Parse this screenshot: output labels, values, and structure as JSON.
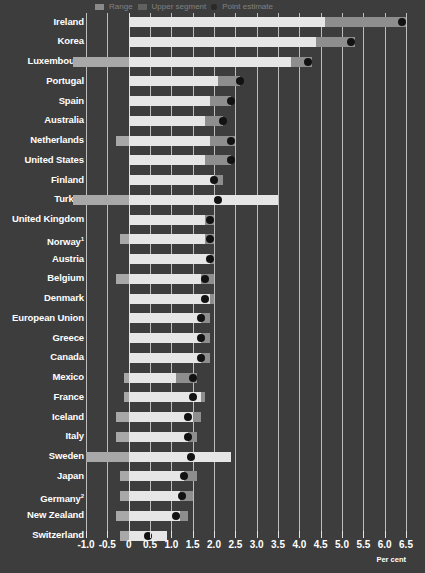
{
  "legend": {
    "items": [
      {
        "label": "Range",
        "swatch": "light-bar-swatch"
      },
      {
        "label": "Upper segment",
        "swatch": "dark-bar-swatch"
      },
      {
        "label": "Point estimate",
        "swatch": "black-dot-marker"
      }
    ]
  },
  "axis": {
    "title": "Per cent",
    "ticks": [
      "-1.0",
      "-0.5",
      "0",
      "0.5",
      "1.0",
      "1.5",
      "2.0",
      "2.5",
      "3.0",
      "3.5",
      "4.0",
      "4.5",
      "5.0",
      "5.5",
      "6.0",
      "6.5"
    ]
  },
  "footnotes": {
    "norway": "1",
    "germany": "2"
  },
  "colors": {
    "background": "#3d3d3d",
    "bar_light": "#e6e6e6",
    "bar_dark": "#8e8e8e",
    "bar_left": "#a8a8a8",
    "marker": "#121212",
    "gridline": "#d8d8d8",
    "text": "#ffffff"
  },
  "chart_data": {
    "type": "bar",
    "orientation": "horizontal",
    "title": "",
    "xlabel": "Per cent",
    "ylabel": "",
    "xlim": [
      -1.0,
      6.5
    ],
    "grid": true,
    "legend_position": "top",
    "categories": [
      "Ireland",
      "Korea",
      "Luxembourg",
      "Portugal",
      "Spain",
      "Australia",
      "Netherlands",
      "United States",
      "Finland",
      "Turkey",
      "United Kingdom",
      "Norway",
      "Austria",
      "Belgium",
      "Denmark",
      "European Union",
      "Greece",
      "Canada",
      "Mexico",
      "France",
      "Iceland",
      "Italy",
      "Sweden",
      "Japan",
      "Germany",
      "New Zealand",
      "Switzerland"
    ],
    "series": [
      {
        "name": "Range start",
        "values": [
          0.0,
          0.0,
          -1.3,
          0.0,
          0.0,
          0.0,
          -0.3,
          0.0,
          0.0,
          -1.3,
          0.0,
          -0.2,
          0.0,
          -0.3,
          0.0,
          0.0,
          0.0,
          0.0,
          -0.1,
          -0.1,
          -0.3,
          -0.3,
          -1.0,
          -0.2,
          -0.2,
          -0.3,
          -0.2
        ]
      },
      {
        "name": "Light segment end",
        "values": [
          4.6,
          4.4,
          3.8,
          2.1,
          1.9,
          1.8,
          1.9,
          1.8,
          2.0,
          3.5,
          1.8,
          1.8,
          1.9,
          1.7,
          1.9,
          1.7,
          1.7,
          1.7,
          1.1,
          1.7,
          1.5,
          1.4,
          2.4,
          1.3,
          1.2,
          1.2,
          0.9
        ]
      },
      {
        "name": "Dark segment end",
        "values": [
          6.5,
          5.3,
          4.3,
          2.6,
          2.4,
          2.2,
          2.5,
          2.4,
          2.2,
          3.5,
          2.0,
          2.0,
          2.0,
          2.0,
          2.0,
          1.9,
          1.9,
          1.9,
          1.6,
          1.8,
          1.7,
          1.6,
          2.4,
          1.6,
          1.5,
          1.4,
          0.9
        ]
      },
      {
        "name": "Point estimate",
        "values": [
          6.4,
          5.2,
          4.2,
          2.6,
          2.4,
          2.2,
          2.4,
          2.4,
          2.0,
          2.1,
          1.9,
          1.9,
          1.9,
          1.8,
          1.8,
          1.7,
          1.7,
          1.7,
          1.5,
          1.5,
          1.4,
          1.4,
          1.45,
          1.3,
          1.25,
          1.1,
          0.45
        ]
      }
    ]
  }
}
